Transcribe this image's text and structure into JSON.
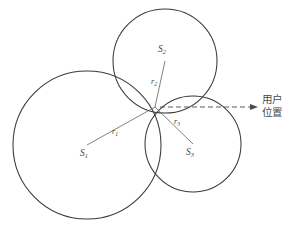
{
  "figure": {
    "type": "geometry-diagram",
    "background_color": "#ffffff",
    "stroke_color": "#3a3a3a",
    "label_color": "#444444"
  },
  "callout": {
    "line1": "用户",
    "line2": "位置",
    "arrow_from_x": 160,
    "arrow_from_y": 107,
    "arrow_to_x": 258,
    "arrow_to_y": 107,
    "style": "dashed-arrow"
  },
  "intersection": {
    "label": "user-position-point",
    "x": 155,
    "y": 107
  },
  "circles": [
    {
      "id": "S1",
      "center_label": "S",
      "center_subscript": "1",
      "cx": 87,
      "cy": 145,
      "r": 74,
      "center_label_x": 80,
      "center_label_y": 156,
      "radius_label": "r",
      "radius_subscript": "1",
      "radius_label_x": 112,
      "radius_label_y": 134
    },
    {
      "id": "S2",
      "center_label": "S",
      "center_subscript": "2",
      "cx": 165,
      "cy": 61,
      "r": 52,
      "center_label_x": 158,
      "center_label_y": 52,
      "radius_label": "r",
      "radius_subscript": "2",
      "radius_label_x": 151,
      "radius_label_y": 84
    },
    {
      "id": "S3",
      "center_label": "S",
      "center_subscript": "3",
      "cx": 193,
      "cy": 144,
      "r": 48,
      "center_label_x": 186,
      "center_label_y": 155,
      "radius_label": "r",
      "radius_subscript": "3",
      "radius_label_x": 174,
      "radius_label_y": 124
    }
  ]
}
